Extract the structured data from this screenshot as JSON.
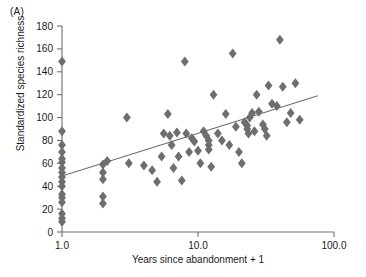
{
  "panel": {
    "label": "(A)"
  },
  "chart_data": {
    "type": "scatter",
    "title": "",
    "xlabel": "Years since abandonment + 1",
    "ylabel": "Standardized species richness",
    "xscale": "log",
    "yscale": "linear",
    "xlim": [
      1.0,
      100.0
    ],
    "ylim": [
      0,
      180
    ],
    "xticks": [
      1.0,
      10.0,
      100.0
    ],
    "xtick_labels": [
      "1.0",
      "10.0",
      "100.0"
    ],
    "yticks": [
      0,
      20,
      40,
      60,
      80,
      100,
      120,
      140,
      160,
      180
    ],
    "ytick_labels": [
      "0",
      "20",
      "40",
      "60",
      "80",
      "100",
      "120",
      "140",
      "160",
      "180"
    ],
    "grid": false,
    "legend": null,
    "marker": {
      "shape": "diamond",
      "color": "#6e6e6e",
      "size": 5
    },
    "trendline": {
      "present": true,
      "color": "#6e6e6e",
      "x_start": 1.0,
      "y_start": 49,
      "x_end": 76.0,
      "y_end": 119
    },
    "points": [
      {
        "x": 1.0,
        "y": 149
      },
      {
        "x": 1.0,
        "y": 88
      },
      {
        "x": 1.0,
        "y": 76
      },
      {
        "x": 1.0,
        "y": 70
      },
      {
        "x": 1.0,
        "y": 64
      },
      {
        "x": 1.0,
        "y": 61
      },
      {
        "x": 1.0,
        "y": 56
      },
      {
        "x": 1.0,
        "y": 52
      },
      {
        "x": 1.0,
        "y": 48
      },
      {
        "x": 1.0,
        "y": 44
      },
      {
        "x": 1.0,
        "y": 40
      },
      {
        "x": 1.0,
        "y": 33
      },
      {
        "x": 1.0,
        "y": 30
      },
      {
        "x": 1.0,
        "y": 26
      },
      {
        "x": 1.0,
        "y": 16
      },
      {
        "x": 1.0,
        "y": 12
      },
      {
        "x": 1.0,
        "y": 9
      },
      {
        "x": 2.0,
        "y": 59
      },
      {
        "x": 2.0,
        "y": 52
      },
      {
        "x": 2.0,
        "y": 46
      },
      {
        "x": 2.0,
        "y": 31
      },
      {
        "x": 2.0,
        "y": 25
      },
      {
        "x": 2.15,
        "y": 62
      },
      {
        "x": 3.0,
        "y": 100
      },
      {
        "x": 3.1,
        "y": 60
      },
      {
        "x": 4.0,
        "y": 58
      },
      {
        "x": 4.6,
        "y": 54
      },
      {
        "x": 5.0,
        "y": 44
      },
      {
        "x": 5.4,
        "y": 66
      },
      {
        "x": 5.6,
        "y": 86
      },
      {
        "x": 6.0,
        "y": 103
      },
      {
        "x": 6.2,
        "y": 84
      },
      {
        "x": 6.4,
        "y": 76
      },
      {
        "x": 6.6,
        "y": 56
      },
      {
        "x": 7.0,
        "y": 87
      },
      {
        "x": 7.2,
        "y": 66
      },
      {
        "x": 7.6,
        "y": 45
      },
      {
        "x": 8.0,
        "y": 149
      },
      {
        "x": 8.2,
        "y": 86
      },
      {
        "x": 8.6,
        "y": 70
      },
      {
        "x": 9.0,
        "y": 82
      },
      {
        "x": 9.4,
        "y": 79
      },
      {
        "x": 10.0,
        "y": 71
      },
      {
        "x": 10.4,
        "y": 60
      },
      {
        "x": 11.0,
        "y": 88
      },
      {
        "x": 11.5,
        "y": 84
      },
      {
        "x": 12.0,
        "y": 80
      },
      {
        "x": 12.0,
        "y": 76
      },
      {
        "x": 12.0,
        "y": 72
      },
      {
        "x": 12.5,
        "y": 57
      },
      {
        "x": 13.0,
        "y": 120
      },
      {
        "x": 14.0,
        "y": 86
      },
      {
        "x": 15.0,
        "y": 80
      },
      {
        "x": 16.0,
        "y": 103
      },
      {
        "x": 17.0,
        "y": 76
      },
      {
        "x": 18.0,
        "y": 156
      },
      {
        "x": 19.0,
        "y": 92
      },
      {
        "x": 20.0,
        "y": 70
      },
      {
        "x": 21.0,
        "y": 60
      },
      {
        "x": 22.0,
        "y": 96
      },
      {
        "x": 23.0,
        "y": 93
      },
      {
        "x": 23.0,
        "y": 90
      },
      {
        "x": 23.5,
        "y": 86
      },
      {
        "x": 24.0,
        "y": 100
      },
      {
        "x": 25.0,
        "y": 104
      },
      {
        "x": 26.0,
        "y": 88
      },
      {
        "x": 27.0,
        "y": 120
      },
      {
        "x": 28.0,
        "y": 105
      },
      {
        "x": 30.0,
        "y": 94
      },
      {
        "x": 31.0,
        "y": 90
      },
      {
        "x": 32.0,
        "y": 84
      },
      {
        "x": 33.0,
        "y": 128
      },
      {
        "x": 35.0,
        "y": 112
      },
      {
        "x": 38.0,
        "y": 110
      },
      {
        "x": 40.0,
        "y": 168
      },
      {
        "x": 42.0,
        "y": 127
      },
      {
        "x": 45.0,
        "y": 96
      },
      {
        "x": 48.0,
        "y": 104
      },
      {
        "x": 52.0,
        "y": 130
      },
      {
        "x": 56.0,
        "y": 98
      }
    ]
  }
}
